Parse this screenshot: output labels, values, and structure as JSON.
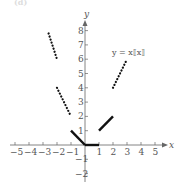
{
  "panel_label": "(d)",
  "chart_data": {
    "type": "line",
    "title": "",
    "function_label": "y = x⟦x⟧",
    "xlabel": "x",
    "ylabel": "y",
    "xlim": [
      -5.5,
      5.8
    ],
    "ylim": [
      -2.5,
      8.8
    ],
    "grid": false,
    "x_ticks": [
      -5,
      -4,
      -3,
      -2,
      -1,
      1,
      2,
      3,
      4,
      5
    ],
    "y_ticks": [
      -2,
      -1,
      1,
      2,
      3,
      4,
      5,
      6,
      7,
      8
    ],
    "series": [
      {
        "name": "x in [-3,-2)",
        "style": "dotted",
        "points": [
          [
            -2.6,
            7.8
          ],
          [
            -2,
            6
          ]
        ]
      },
      {
        "name": "x in [-2,-1)",
        "style": "dotted",
        "points": [
          [
            -2,
            4
          ],
          [
            -1,
            2
          ]
        ]
      },
      {
        "name": "x in [-1,0)",
        "style": "solid",
        "points": [
          [
            -1,
            1
          ],
          [
            0,
            0
          ]
        ]
      },
      {
        "name": "x in [0,1)",
        "style": "solid",
        "points": [
          [
            0,
            0
          ],
          [
            1,
            0
          ]
        ]
      },
      {
        "name": "x in [1,2)",
        "style": "solid",
        "points": [
          [
            1,
            1
          ],
          [
            2,
            2
          ]
        ]
      },
      {
        "name": "x in [2,3)",
        "style": "dotted",
        "points": [
          [
            2,
            4
          ],
          [
            3,
            6
          ]
        ]
      }
    ]
  },
  "colors": {
    "axis": "#666666",
    "curve": "#111111",
    "text": "#555555"
  }
}
